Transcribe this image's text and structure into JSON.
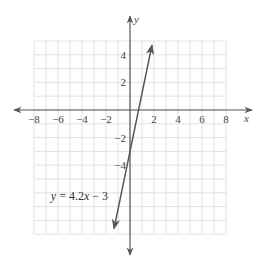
{
  "chart_data": {
    "type": "line",
    "title": "",
    "xlabel": "x",
    "ylabel": "y",
    "xlim": [
      -8,
      8
    ],
    "ylim": [
      -9,
      5
    ],
    "grid": true,
    "x_ticks": [
      -8,
      -6,
      -4,
      -2,
      2,
      4,
      6,
      8
    ],
    "x_tick_labels": [
      "−8",
      "−6",
      "−4",
      "−2",
      "2",
      "4",
      "6",
      "8"
    ],
    "y_ticks": [
      4,
      2,
      -2,
      -4
    ],
    "y_tick_labels": [
      "4",
      "2",
      "−2",
      "−4"
    ],
    "series": [
      {
        "name": "y = 4.2x − 3",
        "slope": 4.2,
        "intercept": -3,
        "x": [
          -1.33,
          1.83
        ],
        "y": [
          -8.6,
          4.7
        ],
        "arrows": "both",
        "color": "#555555"
      }
    ],
    "annotations": [
      {
        "text_parts": [
          "y",
          " = 4.2",
          "x",
          " − 3"
        ],
        "anchor_x": -6.6,
        "anchor_y": -6.5
      }
    ]
  }
}
